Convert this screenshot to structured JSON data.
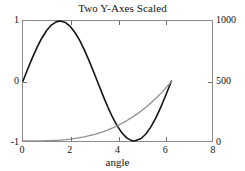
{
  "chart_data": {
    "type": "line",
    "title": "Two Y-Axes Scaled",
    "xlabel": "angle",
    "ylabel": "",
    "xlim": [
      0,
      8
    ],
    "ylim": [
      -1,
      1
    ],
    "y2lim": [
      0,
      1000
    ],
    "grid": false,
    "legend": null,
    "xticks": [
      0,
      2,
      4,
      6,
      8
    ],
    "xtick_labels": [
      "0",
      "2",
      "4",
      "6",
      "8"
    ],
    "yticks_left": [
      -1,
      0,
      1
    ],
    "ytick_labels_left": [
      "-1",
      "0",
      "1"
    ],
    "yticks_right": [
      0,
      500,
      1000
    ],
    "ytick_labels_right": [
      "0",
      "500",
      "1000"
    ],
    "x": [
      0,
      0.2,
      0.4,
      0.6,
      0.8,
      1.0,
      1.2,
      1.4,
      1.5708,
      1.8,
      2.0,
      2.2,
      2.4,
      2.6,
      2.8,
      3.0,
      3.1416,
      3.4,
      3.6,
      3.8,
      4.0,
      4.2,
      4.4,
      4.6,
      4.7124,
      5.0,
      5.2,
      5.4,
      5.6,
      5.8,
      6.0,
      6.2,
      6.2832
    ],
    "series": [
      {
        "name": "sin(angle)",
        "axis": "left",
        "color": "#141414",
        "width": 1.6,
        "values": [
          0,
          0.1987,
          0.3894,
          0.5646,
          0.7174,
          0.8415,
          0.932,
          0.9854,
          1.0,
          0.9738,
          0.9093,
          0.8085,
          0.6755,
          0.5155,
          0.335,
          0.1411,
          0,
          -0.2555,
          -0.4425,
          -0.6119,
          -0.7568,
          -0.8716,
          -0.9516,
          -0.9937,
          -1.0,
          -0.9589,
          -0.8835,
          -0.7728,
          -0.6313,
          -0.4646,
          -0.2794,
          -0.0831,
          0
        ]
      },
      {
        "name": "angle^3 scaled",
        "axis": "right",
        "color": "#8f8f8f",
        "width": 1.3,
        "values": [
          0,
          0.016,
          0.128,
          0.432,
          1.024,
          2.0,
          3.456,
          5.488,
          7.75,
          11.664,
          16.0,
          21.296,
          27.648,
          35.152,
          43.904,
          54.0,
          62.01,
          78.608,
          93.312,
          109.744,
          128.0,
          148.176,
          170.368,
          194.672,
          209.33,
          250.0,
          281.216,
          314.928,
          351.232,
          390.224,
          432.0,
          476.656,
          496.1
        ]
      }
    ]
  },
  "axis": {
    "frame_color": "#8c8c8c",
    "tick_color": "#6e6e6e",
    "text_color": "#141414"
  }
}
